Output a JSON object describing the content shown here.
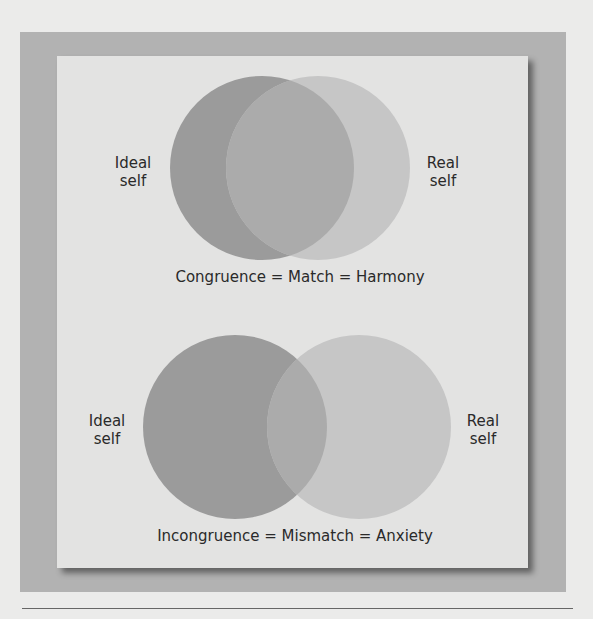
{
  "colors": {
    "page_background": "#ebebea",
    "frame": "#b2b2b2",
    "card": "#e3e3e2",
    "ideal_circle": "#9b9b9b",
    "real_circle": "#c6c6c6",
    "overlap": "#ababab",
    "text": "#2a2a2a"
  },
  "diagrams": [
    {
      "id": "congruence",
      "left_label_line1": "Ideal",
      "left_label_line2": "self",
      "right_label_line1": "Real",
      "right_label_line2": "self",
      "caption": "Congruence = Match = Harmony"
    },
    {
      "id": "incongruence",
      "left_label_line1": "Ideal",
      "left_label_line2": "self",
      "right_label_line1": "Real",
      "right_label_line2": "self",
      "caption": "Incongruence = Mismatch = Anxiety"
    }
  ]
}
